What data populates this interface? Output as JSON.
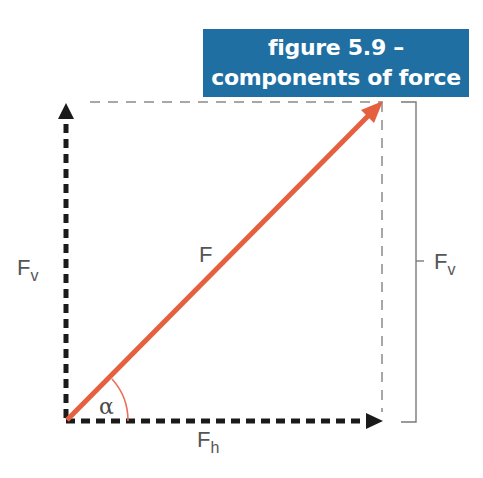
{
  "title": {
    "line1": "figure 5.9 –",
    "line2": "components of force",
    "background": "#1f6fa3",
    "color": "#ffffff"
  },
  "labels": {
    "resultant": "F",
    "vertical_left": "F",
    "vertical_left_sub": "v",
    "vertical_right": "F",
    "vertical_right_sub": "v",
    "horizontal": "F",
    "horizontal_sub": "h",
    "angle": "α"
  },
  "colors": {
    "force_arrow": "#e5603f",
    "angle_arc": "#e8705a",
    "component_arrows": "#1a1a1a",
    "dashed_guides": "#888888",
    "bracket": "#777777",
    "label_text": "#555555"
  },
  "geometry": {
    "origin": [
      66,
      421
    ],
    "force_tip": [
      382,
      102
    ],
    "horizontal_tip": [
      382,
      421
    ],
    "vertical_tip": [
      66,
      103
    ]
  }
}
